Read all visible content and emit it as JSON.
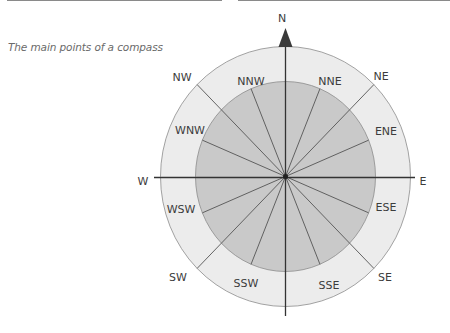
{
  "caption": "The main points of a compass",
  "colors": {
    "outer_ring": "#ececec",
    "inner_disc": "#c9c9c9",
    "circle_stroke": "#8c8c8c",
    "spoke": "#555555",
    "axis": "#333333",
    "arrow": "#3a3a3a",
    "label": "#3c3c3c"
  },
  "compass": {
    "center": [
      285.5,
      176.5
    ],
    "outer_radius": [
      125,
      130
    ],
    "inner_radius": [
      90,
      95
    ],
    "north_arrow": "north-arrow-icon",
    "cardinal_labels": [
      {
        "id": "N",
        "text": "N",
        "x": 282,
        "y": 22
      },
      {
        "id": "E",
        "text": "E",
        "x": 423,
        "y": 185
      },
      {
        "id": "W",
        "text": "W",
        "x": 143,
        "y": 185
      }
    ],
    "ring_labels": [
      {
        "id": "NW",
        "text": "NW",
        "x": 182,
        "y": 81
      },
      {
        "id": "NE",
        "text": "NE",
        "x": 381,
        "y": 80
      },
      {
        "id": "SW",
        "text": "SW",
        "x": 178,
        "y": 281
      },
      {
        "id": "SE",
        "text": "SE",
        "x": 385,
        "y": 281
      }
    ],
    "inner_labels": [
      {
        "id": "NNW",
        "text": "NNW",
        "x": 251,
        "y": 85
      },
      {
        "id": "NNE",
        "text": "NNE",
        "x": 330,
        "y": 85
      },
      {
        "id": "WNW",
        "text": "WNW",
        "x": 190,
        "y": 134
      },
      {
        "id": "ENE",
        "text": "ENE",
        "x": 386,
        "y": 135
      },
      {
        "id": "WSW",
        "text": "WSW",
        "x": 181,
        "y": 213
      },
      {
        "id": "ESE",
        "text": "ESE",
        "x": 386,
        "y": 211
      },
      {
        "id": "SSW",
        "text": "SSW",
        "x": 246,
        "y": 287
      },
      {
        "id": "SSE",
        "text": "SSE",
        "x": 329,
        "y": 289
      }
    ]
  }
}
